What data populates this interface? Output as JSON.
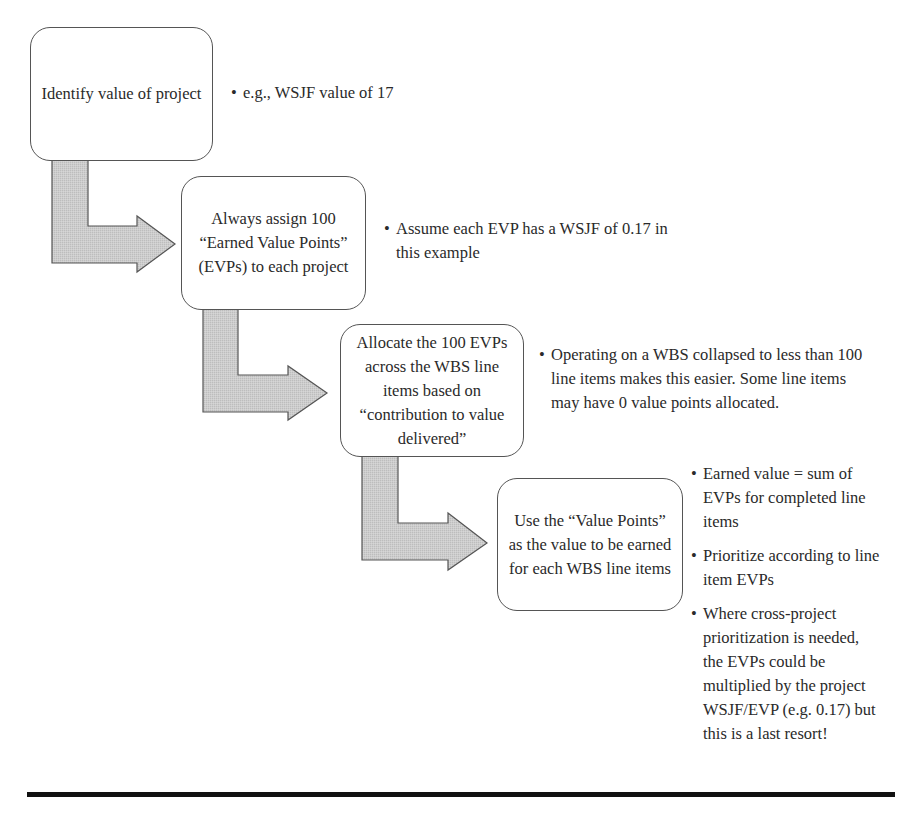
{
  "diagram": {
    "colors": {
      "arrow_fill": "#c8c8c8",
      "arrow_stroke": "#555555",
      "box_border": "#555555",
      "text": "#2a2a2a",
      "rule": "#111111"
    },
    "bullet_glyph": "•",
    "steps": [
      {
        "label": "Identify value of project",
        "notes": [
          "e.g., WSJF value of 17"
        ]
      },
      {
        "label": "Always assign 100 “Earned Value Points” (EVPs) to each project",
        "notes": [
          "Assume each EVP has a WSJF of 0.17 in this example"
        ]
      },
      {
        "label": "Allocate the 100 EVPs across the WBS line items based on “contribution to value delivered”",
        "notes": [
          "Operating on a WBS collapsed to less than 100 line items makes this easier. Some line items may have 0 value points allocated."
        ]
      },
      {
        "label": "Use the “Value Points” as the value to be earned for each WBS line items",
        "notes": [
          "Earned value = sum of EVPs for completed line items",
          "Prioritize according to line item EVPs",
          "Where cross-project prioritization is needed, the EVPs could be multiplied by the project WSJF/EVP (e.g. 0.17) but this is a last resort!"
        ]
      }
    ]
  }
}
